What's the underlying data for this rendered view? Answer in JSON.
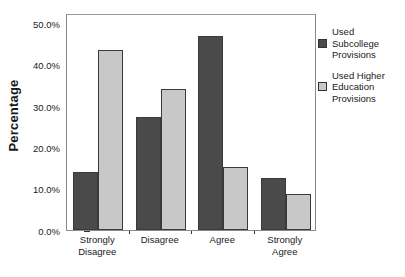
{
  "chart_data": {
    "type": "bar",
    "title": "",
    "xlabel": "",
    "ylabel": "Percentage",
    "categories": [
      "Strongly\nDisagree",
      "Disagree",
      "Agree",
      "Strongly\nAgree"
    ],
    "series": [
      {
        "name": "Used\nSubcollege\nProvisions",
        "color": "#4a4a4a",
        "values": [
          14.0,
          27.3,
          47.0,
          12.7
        ]
      },
      {
        "name": "Used Higher\nEducation\nProvisions",
        "color": "#c8c8c8",
        "values": [
          43.5,
          34.0,
          15.3,
          8.8
        ]
      }
    ],
    "ylim": [
      0,
      52.5
    ],
    "yticks": [
      0,
      10,
      20,
      30,
      40,
      50
    ],
    "ytick_labels": [
      "0.0%",
      "10.0%",
      "20.0%",
      "30.0%",
      "40.0%",
      "50.0%"
    ],
    "grid": false,
    "legend_position": "right"
  },
  "legend": {
    "entries": [
      {
        "label": "Used\nSubcollege\nProvisions",
        "swatch": "dark"
      },
      {
        "label": "Used Higher\nEducation\nProvisions",
        "swatch": "light"
      }
    ]
  }
}
